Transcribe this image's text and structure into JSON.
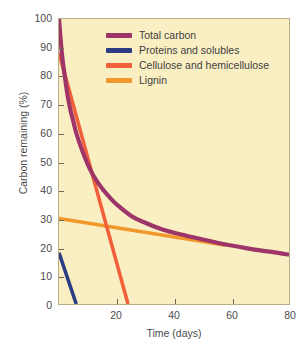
{
  "chart_data": {
    "type": "line",
    "title": "",
    "xlabel": "Time (days)",
    "ylabel": "Carbon remaining (%)",
    "xlim": [
      0,
      80
    ],
    "ylim": [
      0,
      100
    ],
    "xticks": [
      0,
      20,
      40,
      60,
      80
    ],
    "xtick_labels": [
      "",
      "20",
      "40",
      "60",
      "80"
    ],
    "yticks": [
      0,
      10,
      20,
      30,
      40,
      50,
      60,
      70,
      80,
      90,
      100
    ],
    "ytick_labels": [
      "0",
      "10",
      "20",
      "30",
      "40",
      "50",
      "60",
      "70",
      "80",
      "90",
      "100"
    ],
    "grid": false,
    "legend_position": "upper-right-inside",
    "plot_background": "#faeec3",
    "figure_background": "#ffffff",
    "series": [
      {
        "name": "Total carbon",
        "color": "#9e3568",
        "x": [
          0,
          1,
          2,
          3,
          4,
          5,
          6,
          8,
          10,
          12,
          15,
          18,
          20,
          25,
          30,
          35,
          40,
          45,
          50,
          55,
          60,
          65,
          70,
          75,
          80
        ],
        "values": [
          100,
          88,
          80,
          73,
          68,
          64,
          60,
          54,
          49,
          45,
          40.5,
          37,
          35,
          31,
          28.5,
          26.5,
          25,
          23.8,
          22.6,
          21.5,
          20.5,
          19.6,
          18.8,
          18.1,
          17.3
        ]
      },
      {
        "name": "Proteins and solubles",
        "color": "#2b3c84",
        "x": [
          0,
          6
        ],
        "values": [
          18,
          0
        ]
      },
      {
        "name": "Cellulose and hemicellulose",
        "color": "#f1603b",
        "x": [
          0,
          24
        ],
        "values": [
          88,
          0
        ]
      },
      {
        "name": "Lignin",
        "color": "#f1982c",
        "x": [
          0,
          58
        ],
        "values": [
          30,
          20.6
        ]
      }
    ]
  },
  "axes": {
    "y_title": "Carbon remaining (%)",
    "x_title": "Time (days)"
  },
  "legend": {
    "items": [
      {
        "label": "Total carbon",
        "color": "#9e3568"
      },
      {
        "label": "Proteins and solubles",
        "color": "#2b3c84"
      },
      {
        "label": "Cellulose and hemicellulose",
        "color": "#f1603b"
      },
      {
        "label": "Lignin",
        "color": "#f1982c"
      }
    ]
  }
}
